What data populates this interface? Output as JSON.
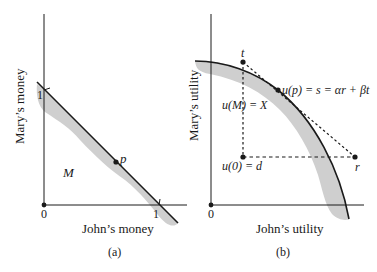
{
  "panel_a": {
    "caption": "(a)",
    "xlabel": "John’s money",
    "ylabel": "Mary’s money",
    "origin_label": "0",
    "x_tick_label": "1",
    "y_tick_label": "1",
    "region_label": "M",
    "point_label": "p"
  },
  "panel_b": {
    "caption": "(b)",
    "xlabel": "John’s utility",
    "ylabel": "Mary’s utility",
    "origin_label": "0",
    "t_label": "t",
    "r_label": "r",
    "up_label": "u(p) = s = αr + βt",
    "uM_label": "u(M) = X",
    "u0_label": "u(0) = d"
  },
  "colors": {
    "ink": "#1a1a1a",
    "shade": "#cfcfcf"
  }
}
